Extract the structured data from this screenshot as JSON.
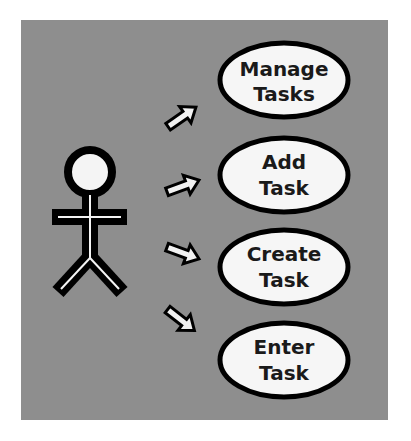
{
  "diagram": {
    "type": "use-case",
    "background_color": "#8e8e8e",
    "actor": {
      "icon": "stick-figure-icon"
    },
    "use_cases": [
      {
        "line1": "Manage",
        "line2": "Tasks"
      },
      {
        "line1": "Add",
        "line2": "Task"
      },
      {
        "line1": "Create",
        "line2": "Task"
      },
      {
        "line1": "Enter",
        "line2": "Task"
      }
    ],
    "arrows": [
      "arrow-up-right",
      "arrow-right-slight-up",
      "arrow-right-slight-down",
      "arrow-down-right"
    ]
  }
}
